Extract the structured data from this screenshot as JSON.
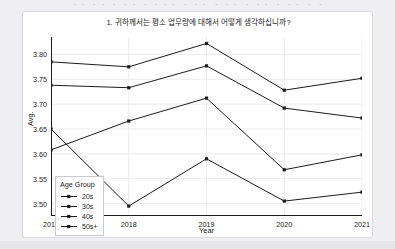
{
  "page": {
    "top_fragment": "ㆍㆍ ㆍㆍ ㆍ ㆍㆍ ㆍ ㆍㆍㆍ ㆍ ㆍㆍ ㆍ ㆍㆍ ㆍ ㆍㆍ ㆍ ㆍㆍ ㆍ ㆍ",
    "background_color": "#efeff1",
    "card_background": "#ffffff"
  },
  "chart_data": {
    "type": "line",
    "title": "1. 귀하께서는 평소 업무량에 대해서 어떻게 생각하십니까?",
    "xlabel": "Year",
    "ylabel": "Avg.",
    "x": [
      2017,
      2018,
      2019,
      2020,
      2021
    ],
    "categories": [
      "2017",
      "2018",
      "2019",
      "2020",
      "2021"
    ],
    "ylim": [
      3.475,
      3.835
    ],
    "yticks": [
      3.5,
      3.55,
      3.6,
      3.65,
      3.7,
      3.75,
      3.8
    ],
    "ytick_labels": [
      "3.50",
      "3.55",
      "3.60",
      "3.65",
      "3.70",
      "3.75",
      "3.80"
    ],
    "grid": true,
    "grid_color": "#ebebed",
    "legend_title": "Age Group",
    "legend_position": "lower-left-inside",
    "line_color": "#1c1c20",
    "marker": "filled-square",
    "series": [
      {
        "name": "20s",
        "values": [
          3.65,
          3.495,
          3.59,
          3.505,
          3.523
        ]
      },
      {
        "name": "30s",
        "values": [
          3.608,
          3.666,
          3.712,
          3.568,
          3.598
        ]
      },
      {
        "name": "40s",
        "values": [
          3.738,
          3.733,
          3.777,
          3.692,
          3.672
        ]
      },
      {
        "name": "50s+",
        "values": [
          3.785,
          3.775,
          3.822,
          3.728,
          3.752
        ]
      }
    ]
  }
}
